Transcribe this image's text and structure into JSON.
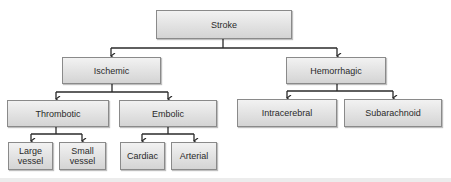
{
  "diagram": {
    "root": {
      "label": "Stroke"
    },
    "level1": [
      {
        "label": "Ischemic"
      },
      {
        "label": "Hemorrhagic"
      }
    ],
    "level2": [
      {
        "label": "Thrombotic",
        "parent": "Ischemic"
      },
      {
        "label": "Embolic",
        "parent": "Ischemic"
      },
      {
        "label": "Intracerebral",
        "parent": "Hemorrhagic"
      },
      {
        "label": "Subarachnoid",
        "parent": "Hemorrhagic"
      }
    ],
    "level3": [
      {
        "label": "Large\nvessel",
        "parent": "Thrombotic"
      },
      {
        "label": "Small\nvessel",
        "parent": "Thrombotic"
      },
      {
        "label": "Cardiac",
        "parent": "Embolic"
      },
      {
        "label": "Arterial",
        "parent": "Embolic"
      }
    ],
    "colors": {
      "box_top": "#f2f2f2",
      "box_bottom": "#d4d4d4",
      "border": "#8a8a8a",
      "connector": "#2a2a2a",
      "text": "#2a2a2a"
    }
  }
}
